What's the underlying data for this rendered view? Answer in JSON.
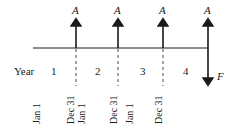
{
  "diagram": {
    "type": "cash-flow-timeline",
    "row_label": "Year",
    "periods": [
      "1",
      "2",
      "3",
      "4"
    ],
    "payment_label": "A",
    "future_value_label": "F",
    "date_labels": [
      {
        "text": "Jan 1"
      },
      {
        "text": "Dec 31"
      },
      {
        "text": "Jan 1"
      },
      {
        "text": "Dec 31"
      },
      {
        "text": "Jan 1"
      },
      {
        "text": "Dec 31"
      }
    ],
    "colors": {
      "ink": "#1a1a1a",
      "background": "#ffffff"
    }
  }
}
